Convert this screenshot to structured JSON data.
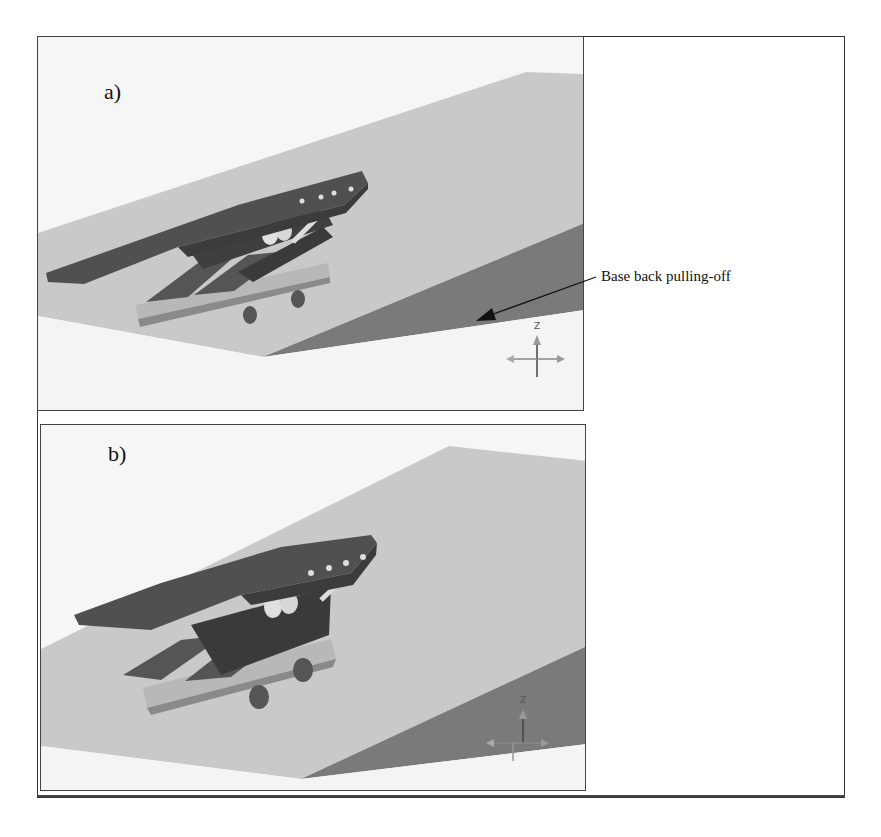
{
  "figure": {
    "panels": [
      {
        "id": "a",
        "label": "a)"
      },
      {
        "id": "b",
        "label": "b)"
      }
    ],
    "annotation": {
      "text": "Base back pulling-off",
      "target_panel": "a"
    },
    "axis_triad_labels": [
      "Z",
      "Y",
      "X"
    ],
    "colors": {
      "slope_light": "#c9c9c9",
      "slope_dark": "#7a7a7a",
      "ground": "#f4f4f4",
      "platform_dark": "#4a4a4a",
      "base_light": "#b5b5b5",
      "frame": "#333333"
    }
  }
}
